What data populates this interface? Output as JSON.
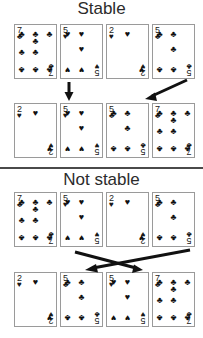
{
  "figure": {
    "sections": [
      {
        "id": "stable",
        "heading": "Stable",
        "input_row": [
          {
            "rank": "7",
            "suit": "club",
            "suit_glyph": "♣",
            "count": 7
          },
          {
            "rank": "5",
            "suit": "heart",
            "suit_glyph": "♥",
            "count": 5
          },
          {
            "rank": "2",
            "suit": "heart",
            "suit_glyph": "♥",
            "count": 2
          },
          {
            "rank": "5",
            "suit": "club",
            "suit_glyph": "♣",
            "count": 5
          }
        ],
        "output_row": [
          {
            "rank": "2",
            "suit": "heart",
            "suit_glyph": "♥",
            "count": 2
          },
          {
            "rank": "5",
            "suit": "heart",
            "suit_glyph": "♥",
            "count": 5
          },
          {
            "rank": "5",
            "suit": "club",
            "suit_glyph": "♣",
            "count": 5
          },
          {
            "rank": "7",
            "suit": "club",
            "suit_glyph": "♣",
            "count": 7
          }
        ],
        "arrows": [
          {
            "name": "arrow-5heart-straight-down",
            "from_index": 1,
            "to_index": 1,
            "kind": "vertical"
          },
          {
            "name": "arrow-5club-down-left",
            "from_index": 3,
            "to_index": 2,
            "kind": "diagonal"
          }
        ]
      },
      {
        "id": "not-stable",
        "heading": "Not stable",
        "input_row": [
          {
            "rank": "7",
            "suit": "club",
            "suit_glyph": "♣",
            "count": 7
          },
          {
            "rank": "5",
            "suit": "heart",
            "suit_glyph": "♥",
            "count": 5
          },
          {
            "rank": "2",
            "suit": "heart",
            "suit_glyph": "♥",
            "count": 2
          },
          {
            "rank": "5",
            "suit": "club",
            "suit_glyph": "♣",
            "count": 5
          }
        ],
        "output_row": [
          {
            "rank": "2",
            "suit": "heart",
            "suit_glyph": "♥",
            "count": 2
          },
          {
            "rank": "5",
            "suit": "club",
            "suit_glyph": "♣",
            "count": 5
          },
          {
            "rank": "5",
            "suit": "heart",
            "suit_glyph": "♥",
            "count": 5
          },
          {
            "rank": "7",
            "suit": "club",
            "suit_glyph": "♣",
            "count": 7
          }
        ],
        "arrows": [
          {
            "name": "arrow-5heart-cross-right",
            "from_index": 1,
            "to_index": 2,
            "kind": "cross-right"
          },
          {
            "name": "arrow-5club-cross-left",
            "from_index": 3,
            "to_index": 1,
            "kind": "cross-left"
          }
        ]
      }
    ],
    "colors": {
      "ink": "#111111",
      "card_border": "#9a9a9a",
      "divider": "#4a4a4a",
      "background": "#ffffff"
    }
  }
}
